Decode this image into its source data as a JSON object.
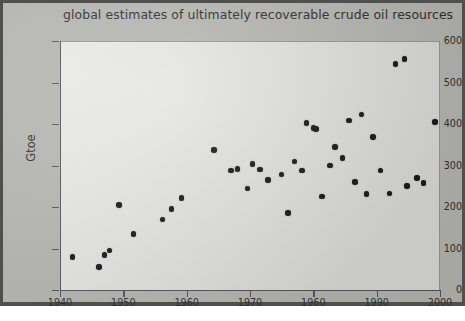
{
  "chart_data": {
    "type": "scatter",
    "title": "global estimates of ultimately recoverable crude oil resources",
    "xlabel": "",
    "ylabel": "Gtoe",
    "xlim": [
      1940,
      2000
    ],
    "ylim": [
      0,
      600
    ],
    "xticks": [
      1940,
      1950,
      1960,
      1970,
      1960,
      1990,
      2000
    ],
    "yticks": [
      0,
      100,
      200,
      300,
      400,
      500,
      600
    ],
    "grid": false,
    "legend": null,
    "marker": "filled-circle",
    "marker_color": "#17171a",
    "points": [
      {
        "x": 1942.0,
        "y": 80
      },
      {
        "x": 1946.2,
        "y": 55
      },
      {
        "x": 1947.0,
        "y": 85
      },
      {
        "x": 1947.8,
        "y": 95
      },
      {
        "x": 1949.3,
        "y": 205
      },
      {
        "x": 1951.6,
        "y": 135
      },
      {
        "x": 1956.2,
        "y": 170
      },
      {
        "x": 1957.6,
        "y": 195
      },
      {
        "x": 1959.2,
        "y": 222
      },
      {
        "x": 1964.3,
        "y": 337
      },
      {
        "x": 1967.0,
        "y": 288
      },
      {
        "x": 1968.0,
        "y": 292
      },
      {
        "x": 1969.6,
        "y": 245
      },
      {
        "x": 1970.4,
        "y": 303
      },
      {
        "x": 1971.6,
        "y": 290
      },
      {
        "x": 1972.8,
        "y": 265
      },
      {
        "x": 1975.0,
        "y": 278
      },
      {
        "x": 1976.0,
        "y": 185
      },
      {
        "x": 1977.0,
        "y": 310
      },
      {
        "x": 1978.2,
        "y": 288
      },
      {
        "x": 1978.9,
        "y": 403
      },
      {
        "x": 1980.0,
        "y": 390
      },
      {
        "x": 1980.4,
        "y": 388
      },
      {
        "x": 1981.4,
        "y": 225
      },
      {
        "x": 1982.6,
        "y": 300
      },
      {
        "x": 1983.4,
        "y": 345
      },
      {
        "x": 1984.6,
        "y": 318
      },
      {
        "x": 1985.6,
        "y": 408
      },
      {
        "x": 1986.6,
        "y": 260
      },
      {
        "x": 1987.6,
        "y": 423
      },
      {
        "x": 1988.4,
        "y": 231
      },
      {
        "x": 1989.4,
        "y": 368
      },
      {
        "x": 1990.6,
        "y": 288
      },
      {
        "x": 1992.0,
        "y": 233
      },
      {
        "x": 1993.0,
        "y": 545
      },
      {
        "x": 1994.4,
        "y": 556
      },
      {
        "x": 1994.8,
        "y": 250
      },
      {
        "x": 1996.4,
        "y": 270
      },
      {
        "x": 1997.4,
        "y": 258
      },
      {
        "x": 1999.2,
        "y": 405
      }
    ]
  }
}
